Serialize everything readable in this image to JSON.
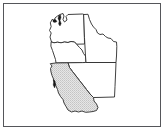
{
  "figure": {
    "kind": "line-art-map",
    "title": "",
    "background_color": "#ffffff",
    "frame": {
      "visible": true,
      "color": "#55565a",
      "x": 3,
      "y": 3,
      "width": 158,
      "height": 124
    }
  },
  "map": {
    "region_label": "",
    "outline_color": "#2b2b2b",
    "shade_color": "#d8d8d8",
    "water_color": "#1a1a1a",
    "states": [
      {
        "name": "washington",
        "label": "",
        "shaded": false,
        "fill": "#ffffff",
        "path": "M 50.5 22.5 L 52.5 19.0 L 54.0 21.5 L 55.0 18.0 L 57.5 16.0 L 60.0 14.5 L 63.0 13.5 L 64.0 16.0 L 63.0 19.5 L 64.5 22.0 L 67.0 20.0 L 66.0 16.5 L 68.0 14.5 L 82.5 14.0 L 84.0 14.5 L 84.5 44.0 L 76.5 44.2 L 74.5 42.0 L 71.0 41.5 L 68.0 42.5 L 64.5 42.0 L 61.0 42.8 L 57.5 42.2 L 54.0 42.8 L 51.5 42.0 L 50.0 37.0 L 51.2 33.0 L 49.5 30.5 L 51.0 27.0 Z"
      },
      {
        "name": "oregon",
        "label": "",
        "shaded": false,
        "fill": "#ffffff",
        "path": "M 51.5 42.0 L 54.0 42.8 L 57.5 42.2 L 61.0 42.8 L 64.5 42.0 L 68.0 42.5 L 71.0 41.5 L 74.5 42.0 L 76.5 44.2 L 79.5 47.5 L 82.0 50.0 L 83.5 53.5 L 85.5 56.0 L 86.0 62.5 L 82.0 62.6 L 75.0 62.7 L 68.0 62.8 L 61.0 62.9 L 56.0 63.0 L 55.5 59.5 L 54.0 55.0 L 52.5 50.5 L 51.0 46.5 Z"
      },
      {
        "name": "idaho",
        "label": "",
        "shaded": false,
        "fill": "#ffffff",
        "path": "M 84.0 14.5 L 88.0 14.3 L 89.5 19.5 L 91.5 24.0 L 93.5 27.0 L 96.0 29.5 L 97.5 33.0 L 100.0 34.5 L 103.0 34.0 L 105.5 36.5 L 108.0 38.0 L 111.0 38.5 L 113.5 41.5 L 116.5 42.0 L 116.8 46.5 L 116.5 56.0 L 116.0 62.5 L 108.0 62.5 L 98.0 62.5 L 90.0 62.5 L 86.0 62.5 L 85.5 56.0 L 85.0 47.0 L 84.5 38.0 Z"
      },
      {
        "name": "nevada",
        "label": "",
        "shaded": false,
        "fill": "#ffffff",
        "path": "M 86.0 62.5 L 98.0 62.5 L 108.0 62.5 L 116.0 62.5 L 115.5 75.0 L 115.0 86.5 L 114.5 97.0 L 107.0 97.2 L 100.0 97.4 L 93.5 97.5 L 90.0 94.0 L 86.5 89.5 L 83.0 85.0 L 79.5 80.5 L 76.0 76.0 L 72.5 71.5 L 69.5 67.5 L 68.0 62.8 L 75.0 62.7 L 82.0 62.6 Z"
      },
      {
        "name": "california",
        "label": "",
        "shaded": true,
        "fill": "#d8d8d8",
        "path": "M 56.0 63.0 L 61.0 62.9 L 68.0 62.8 L 69.5 67.5 L 72.5 71.5 L 76.0 76.0 L 79.5 80.5 L 83.0 85.0 L 86.5 89.5 L 90.0 94.0 L 93.5 97.5 L 94.0 101.0 L 96.5 104.0 L 98.0 107.5 L 96.5 110.5 L 93.0 111.5 L 89.5 112.0 L 85.5 112.3 L 82.0 111.0 L 78.5 112.0 L 75.0 111.0 L 71.5 112.0 L 68.0 110.0 L 66.0 106.5 L 64.0 103.0 L 63.0 99.5 L 60.5 96.5 L 58.5 93.0 L 57.5 89.5 L 56.0 86.0 L 54.5 82.5 L 53.5 79.0 L 52.0 75.5 L 51.0 72.0 L 50.5 68.5 L 52.0 66.0 L 50.5 64.0 Z"
      }
    ],
    "markers": [
      {
        "name": "puget-sound-water",
        "label": "",
        "path": "M 58.8 15.5 L 60.5 15.0 L 61.0 17.5 L 60.0 20.5 L 61.2 23.5 L 60.0 26.0 L 58.6 24.0 L 59.2 21.0 L 58.0 18.5 Z"
      },
      {
        "name": "olympic-inlet-water",
        "label": "",
        "path": "M 53.0 20.0 L 55.5 19.5 L 57.0 21.5 L 55.0 22.5 L 53.2 22.0 Z"
      },
      {
        "name": "san-francisco-bay-water",
        "label": "",
        "path": "M 53.2 79.5 L 55.0 81.0 L 55.6 84.5 L 54.6 88.0 L 53.2 85.0 L 53.6 82.0 Z"
      }
    ]
  }
}
